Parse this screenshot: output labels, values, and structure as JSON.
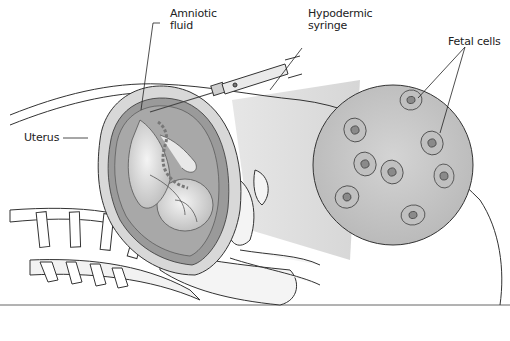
{
  "figure": {
    "labels": {
      "amniotic_fluid": "Amniotic\nfluid",
      "amniotic_fluid_l1": "Amniotic",
      "amniotic_fluid_l2": "fluid",
      "syringe_l1": "Hypodermic",
      "syringe_l2": "syringe",
      "fetal_cells": "Fetal cells",
      "uterus": "Uterus"
    },
    "colors": {
      "background": "#ffffff",
      "line": "#333333",
      "fill_light": "#e6e6e6",
      "fill_mid": "#bdbdbd",
      "fill_dark": "#7a7a7a",
      "magnified_circle": "#c8c8c8"
    },
    "cell_count": 8
  }
}
